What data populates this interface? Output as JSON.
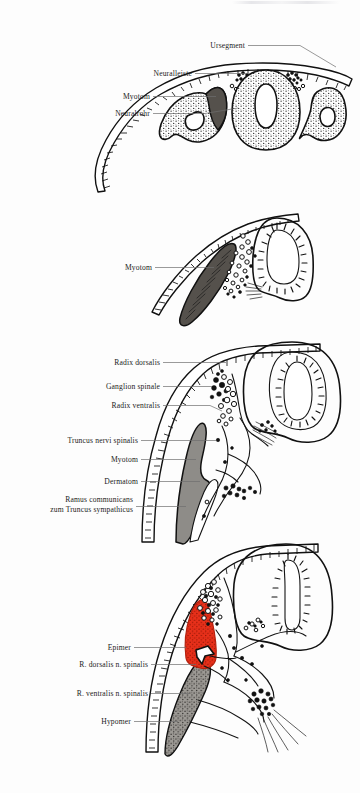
{
  "figure": {
    "background_color": "#fdfdfd",
    "ink_color": "#111111",
    "accent_red": "#e8301a",
    "muscle_gray": "#8e8c88",
    "dark_gray": "#55514c",
    "panel_count": 4
  },
  "panels": [
    {
      "id": "panel-1",
      "stage": "A",
      "description": "Querschnitt mit Neuralrohr, Neuralleiste und Ursegmenten",
      "labels": [
        {
          "id": "ursegment",
          "text": "Ursegment"
        },
        {
          "id": "neuralleiste",
          "text": "Neuralleiste"
        },
        {
          "id": "myotom",
          "text": "Myotom"
        },
        {
          "id": "neuralrohr",
          "text": "Neuralrohr"
        }
      ]
    },
    {
      "id": "panel-2",
      "stage": "B",
      "description": "Neuralrohr mit auswandernden Neuralleistenzellen und Myotom",
      "labels": [
        {
          "id": "myotom",
          "text": "Myotom"
        }
      ]
    },
    {
      "id": "panel-3",
      "stage": "C",
      "description": "Spinalnerv mit Radix dorsalis, Ganglion spinale und Radix ventralis",
      "labels": [
        {
          "id": "radix-dorsalis",
          "text": "Radix dorsalis"
        },
        {
          "id": "ganglion-spinale",
          "text": "Ganglion spinale"
        },
        {
          "id": "radix-ventralis",
          "text": "Radix ventralis"
        },
        {
          "id": "truncus-nervi-spinalis",
          "text": "Truncus nervi spinalis"
        },
        {
          "id": "myotom",
          "text": "Myotom"
        },
        {
          "id": "dermatom",
          "text": "Dermatom"
        },
        {
          "id": "ramus-communicans",
          "text": "Ramus communicans",
          "text_line2": "zum Truncus sympathicus"
        }
      ]
    },
    {
      "id": "panel-4",
      "stage": "D",
      "description": "Aufteilung in Epimer und Hypomer mit Rami dorsalis und ventralis",
      "labels": [
        {
          "id": "epimer",
          "text": "Epimer"
        },
        {
          "id": "r-dorsalis-n-spinalis",
          "text": "R. dorsalis n. spinalis"
        },
        {
          "id": "r-ventralis-n-spinalis",
          "text": "R. ventralis n. spinalis"
        },
        {
          "id": "hypomer",
          "text": "Hypomer"
        }
      ]
    }
  ]
}
